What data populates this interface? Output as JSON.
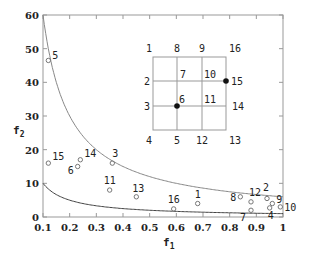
{
  "chart_data": {
    "type": "scatter",
    "title": "",
    "xlabel": "f1",
    "ylabel": "f2",
    "xlim": [
      0.1,
      1.0
    ],
    "ylim": [
      0,
      60
    ],
    "xticks": [
      "0.1",
      "0.2",
      "0.3",
      "0.4",
      "0.5",
      "0.6",
      "0.7",
      "0.8",
      "0.9",
      "1"
    ],
    "yticks": [
      "0",
      "10",
      "20",
      "30",
      "40",
      "50",
      "60"
    ],
    "grid": false,
    "curves": [
      {
        "name": "upper-bound",
        "formula": "f2 = 6/f1",
        "color": "#888888"
      },
      {
        "name": "lower-bound",
        "formula": "f2 = 1/f1",
        "color": "#444444"
      }
    ],
    "points": [
      {
        "label": "1",
        "f1": 0.68,
        "f2": 4.0
      },
      {
        "label": "2",
        "f1": 0.94,
        "f2": 5.5
      },
      {
        "label": "3",
        "f1": 0.36,
        "f2": 16.0
      },
      {
        "label": "4",
        "f1": 0.95,
        "f2": 2.7
      },
      {
        "label": "5",
        "f1": 0.12,
        "f2": 46.5
      },
      {
        "label": "6",
        "f1": 0.23,
        "f2": 15.0
      },
      {
        "label": "7",
        "f1": 0.88,
        "f2": 2.0
      },
      {
        "label": "8",
        "f1": 0.84,
        "f2": 6.0
      },
      {
        "label": "9",
        "f1": 0.96,
        "f2": 4.0
      },
      {
        "label": "10",
        "f1": 0.99,
        "f2": 3.0
      },
      {
        "label": "11",
        "f1": 0.35,
        "f2": 8.0
      },
      {
        "label": "12",
        "f1": 0.88,
        "f2": 4.5
      },
      {
        "label": "13",
        "f1": 0.45,
        "f2": 6.0
      },
      {
        "label": "14",
        "f1": 0.24,
        "f2": 17.0
      },
      {
        "label": "15",
        "f1": 0.12,
        "f2": 16.0
      },
      {
        "label": "16",
        "f1": 0.59,
        "f2": 2.4
      }
    ],
    "inset": {
      "type": "grid-diagram",
      "rows": 3,
      "cols": 3,
      "node_labels": {
        "top": [
          "1",
          "8",
          "9",
          "16"
        ],
        "row1": [
          "2",
          "7",
          "10",
          "15"
        ],
        "row2": [
          "3",
          "6",
          "11",
          "14"
        ],
        "bottom": [
          "4",
          "5",
          "12",
          "13"
        ]
      },
      "highlighted_nodes": [
        "6",
        "15"
      ]
    }
  }
}
